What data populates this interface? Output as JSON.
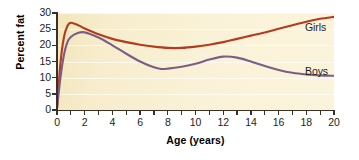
{
  "chart_data": {
    "type": "line",
    "title": "",
    "xlabel": "Age (years)",
    "ylabel": "Percent fat",
    "xlim": [
      0,
      20
    ],
    "ylim": [
      0,
      30
    ],
    "grid": true,
    "legend_position": "inline-right",
    "xticks": [
      0,
      2,
      4,
      6,
      8,
      10,
      12,
      14,
      16,
      18,
      20
    ],
    "xticks_minor": [
      1,
      3,
      5,
      7,
      9,
      11,
      13,
      15,
      17,
      19
    ],
    "yticks": [
      0,
      5,
      10,
      15,
      20,
      25,
      30
    ],
    "xtick_labels": [
      "0",
      "2",
      "4",
      "6",
      "8",
      "10",
      "12",
      "14",
      "16",
      "18",
      "20"
    ],
    "ytick_labels": [
      "0",
      "5",
      "10",
      "15",
      "20",
      "25",
      "30"
    ],
    "series": [
      {
        "name": "Girls",
        "color": "#b63a1e",
        "x": [
          0,
          0.25,
          0.5,
          0.75,
          1,
          1.5,
          2,
          3,
          4,
          5,
          6,
          7,
          8,
          9,
          10,
          11,
          12,
          13,
          14,
          15,
          16,
          17,
          18,
          19,
          20
        ],
        "values": [
          0.5,
          14.5,
          22.5,
          26.0,
          27.0,
          26.3,
          25.2,
          23.4,
          22.0,
          21.0,
          20.2,
          19.6,
          19.2,
          19.2,
          19.6,
          20.2,
          21.0,
          22.0,
          23.0,
          24.0,
          25.1,
          26.2,
          27.3,
          28.2,
          28.8
        ]
      },
      {
        "name": "Boys",
        "color": "#7b5e86",
        "x": [
          0,
          0.25,
          0.5,
          0.75,
          1,
          1.5,
          2,
          3,
          4,
          5,
          6,
          7,
          7.5,
          8,
          9,
          10,
          11,
          12,
          13,
          14,
          15,
          16,
          17,
          18,
          19,
          20
        ],
        "values": [
          0.5,
          10.0,
          17.0,
          21.0,
          22.6,
          23.8,
          24.0,
          22.4,
          20.0,
          17.4,
          15.0,
          13.2,
          12.7,
          12.8,
          13.4,
          14.3,
          15.6,
          16.5,
          16.2,
          15.0,
          13.6,
          12.4,
          11.5,
          11.0,
          10.7,
          10.6
        ]
      }
    ],
    "annotations": [
      {
        "text": "Girls",
        "series": "Girls"
      },
      {
        "text": "Boys",
        "series": "Boys"
      }
    ]
  },
  "colors": {
    "girls": "#b63a1e",
    "boys": "#7b5e86",
    "plot_background": "#f7edcd",
    "axis": "#3a3026",
    "gridline": "#ffffff",
    "text": "#1d1d1d"
  }
}
